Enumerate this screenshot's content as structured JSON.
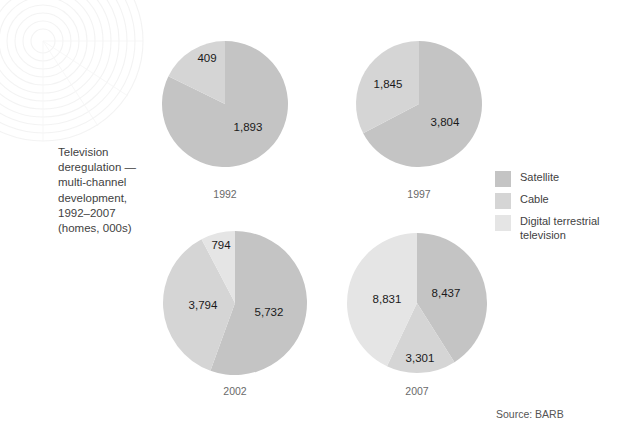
{
  "title": {
    "lines": [
      "Television",
      "deregulation —",
      "multi-channel",
      "development,",
      "1992–2007",
      "(homes, 000s)"
    ]
  },
  "legend": {
    "items": [
      {
        "label": "Satellite",
        "color": "#c4c4c4"
      },
      {
        "label": "Cable",
        "color": "#d5d5d5"
      },
      {
        "label": "Digital terrestrial television",
        "color": "#e5e5e5"
      }
    ]
  },
  "source": "Source: BARB",
  "chart_data": {
    "type": "pie",
    "title": "Television deregulation — multi-channel development, 1992–2007 (homes, 000s)",
    "unit": "homes, 000s",
    "source": "Source: BARB",
    "legend_position": "right",
    "series_names": [
      "Satellite",
      "Cable",
      "Digital terrestrial television"
    ],
    "colors": {
      "Satellite": "#c4c4c4",
      "Cable": "#d5d5d5",
      "Digital terrestrial television": "#e5e5e5"
    },
    "pies": [
      {
        "year": "1992",
        "total": 2302,
        "slices": [
          {
            "name": "Satellite",
            "value": 1893,
            "label": "1,893"
          },
          {
            "name": "Cable",
            "value": 409,
            "label": "409"
          }
        ]
      },
      {
        "year": "1997",
        "total": 5649,
        "slices": [
          {
            "name": "Satellite",
            "value": 3804,
            "label": "3,804"
          },
          {
            "name": "Cable",
            "value": 1845,
            "label": "1,845"
          }
        ]
      },
      {
        "year": "2002",
        "total": 10320,
        "slices": [
          {
            "name": "Satellite",
            "value": 5732,
            "label": "5,732"
          },
          {
            "name": "Cable",
            "value": 3794,
            "label": "3,794"
          },
          {
            "name": "Digital terrestrial television",
            "value": 794,
            "label": "794"
          }
        ]
      },
      {
        "year": "2007",
        "total": 20569,
        "slices": [
          {
            "name": "Satellite",
            "value": 8437,
            "label": "8,437"
          },
          {
            "name": "Cable",
            "value": 3301,
            "label": "3,301"
          },
          {
            "name": "Digital terrestrial television",
            "value": 8831,
            "label": "8,831"
          }
        ]
      }
    ]
  },
  "layout": {
    "pie_boxes": [
      {
        "year": "1992",
        "cx": 225,
        "cy": 104,
        "r": 63,
        "year_y": 188
      },
      {
        "year": "1997",
        "cx": 419,
        "cy": 104,
        "r": 63,
        "year_y": 188
      },
      {
        "year": "2002",
        "cx": 235,
        "cy": 303,
        "r": 72,
        "year_y": 385
      },
      {
        "year": "2007",
        "cx": 417,
        "cy": 303,
        "r": 70,
        "year_y": 385
      }
    ],
    "label_positions": [
      {
        "year": "1992",
        "name": "Satellite",
        "x": 248,
        "y": 127
      },
      {
        "year": "1992",
        "name": "Cable",
        "x": 207,
        "y": 58
      },
      {
        "year": "1997",
        "name": "Satellite",
        "x": 445,
        "y": 122
      },
      {
        "year": "1997",
        "name": "Cable",
        "x": 388,
        "y": 84
      },
      {
        "year": "2002",
        "name": "Satellite",
        "x": 269,
        "y": 312
      },
      {
        "year": "2002",
        "name": "Cable",
        "x": 203,
        "y": 305
      },
      {
        "year": "2002",
        "name": "Digital terrestrial television",
        "x": 221,
        "y": 245
      },
      {
        "year": "2007",
        "name": "Satellite",
        "x": 446,
        "y": 293
      },
      {
        "year": "2007",
        "name": "Cable",
        "x": 420,
        "y": 358
      },
      {
        "year": "2007",
        "name": "Digital terrestrial television",
        "x": 387,
        "y": 299
      }
    ]
  }
}
